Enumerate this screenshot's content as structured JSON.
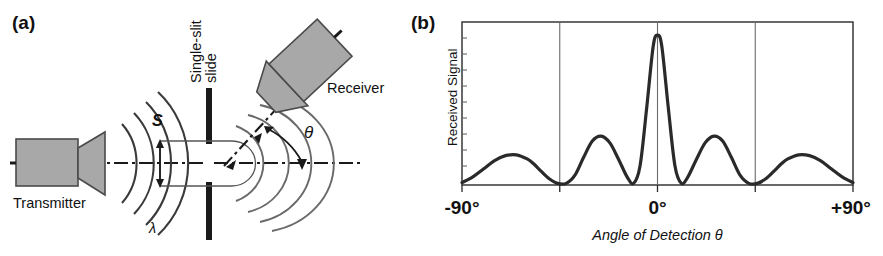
{
  "figure": {
    "panel_a": {
      "label": "(a)",
      "transmitter_label": "Transmitter",
      "receiver_label": "Receiver",
      "slide_label_line1": "Single-slit",
      "slide_label_line2": "slide",
      "slit_width_symbol": "S",
      "angle_symbol": "θ",
      "wavelength_symbol": "λ",
      "colors": {
        "device_fill": "#a8a8a8",
        "device_stroke": "#4a4a4a",
        "slide": "#1a1a1a",
        "wavefront": "#3a3a3a",
        "axis": "#1a1a1a"
      }
    },
    "panel_b": {
      "label": "(b)",
      "chart_data": {
        "type": "line",
        "title": "",
        "xlabel": "Angle of Detection θ",
        "ylabel": "Received Signal",
        "xlim": [
          -90,
          90
        ],
        "ylim": [
          0,
          1
        ],
        "grid": true,
        "gridlines_x": [
          -45,
          0,
          45
        ],
        "xticks": [
          -90,
          0,
          90
        ],
        "xticklabels": [
          "-90°",
          "0°",
          "+90°"
        ],
        "yticklabels": [],
        "legend": "none",
        "series": [
          {
            "name": "Received Signal",
            "x": [
              -90,
              -85,
              -80,
              -75,
              -70,
              -65,
              -60,
              -57,
              -54,
              -50,
              -46,
              -42,
              -38,
              -34,
              -30,
              -26,
              -22,
              -18,
              -14,
              -11,
              -8,
              -5,
              -2,
              0,
              2,
              5,
              8,
              11,
              14,
              18,
              22,
              26,
              30,
              34,
              38,
              42,
              46,
              50,
              54,
              57,
              60,
              65,
              70,
              75,
              80,
              85,
              90
            ],
            "y": [
              0.015,
              0.05,
              0.1,
              0.15,
              0.18,
              0.185,
              0.16,
              0.13,
              0.09,
              0.04,
              0.01,
              0.01,
              0.06,
              0.17,
              0.27,
              0.3,
              0.26,
              0.16,
              0.05,
              0.01,
              0.12,
              0.47,
              0.85,
              0.92,
              0.85,
              0.47,
              0.12,
              0.01,
              0.05,
              0.16,
              0.26,
              0.3,
              0.27,
              0.17,
              0.06,
              0.01,
              0.01,
              0.04,
              0.09,
              0.13,
              0.16,
              0.185,
              0.18,
              0.15,
              0.1,
              0.05,
              0.015
            ]
          }
        ],
        "peaks": [
          {
            "angle": 0,
            "height": 0.92,
            "name": "central-maximum"
          },
          {
            "angle": -26,
            "height": 0.3,
            "name": "first-side-lobe-left"
          },
          {
            "angle": 26,
            "height": 0.3,
            "name": "first-side-lobe-right"
          },
          {
            "angle": -64,
            "height": 0.185,
            "name": "second-side-lobe-left"
          },
          {
            "angle": 64,
            "height": 0.185,
            "name": "second-side-lobe-right"
          }
        ],
        "minima": [
          -44,
          -12,
          12,
          44
        ]
      }
    }
  }
}
